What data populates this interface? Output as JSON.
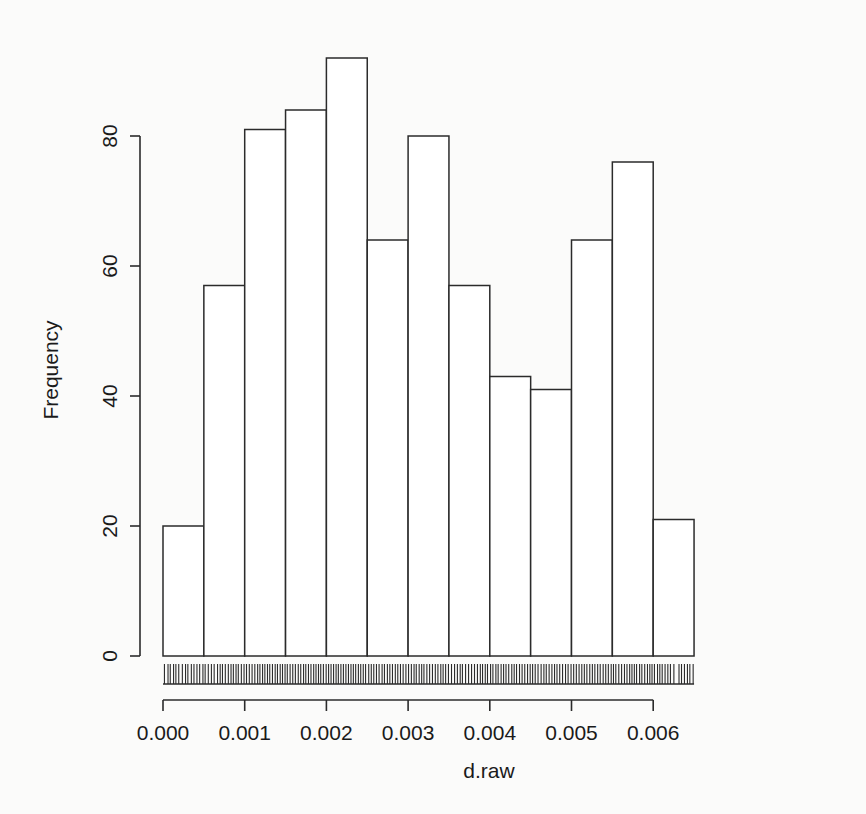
{
  "chart_data": {
    "type": "bar",
    "title": "",
    "subtitle": "",
    "xlabel": "d.raw",
    "ylabel": "Frequency",
    "xlim": [
      -0.0001,
      0.00645
    ],
    "ylim": [
      0,
      92
    ],
    "grid": false,
    "legend": false,
    "legend_position": "none",
    "bin_width": 0.0005,
    "bin_edges": [
      0.0,
      0.0005,
      0.001,
      0.0015,
      0.002,
      0.0025,
      0.003,
      0.0035,
      0.004,
      0.0045,
      0.005,
      0.0055,
      0.006,
      0.0065
    ],
    "categories": [
      "0.0000-0.0005",
      "0.0005-0.0010",
      "0.0010-0.0015",
      "0.0015-0.0020",
      "0.0020-0.0025",
      "0.0025-0.0030",
      "0.0030-0.0035",
      "0.0035-0.0040",
      "0.0040-0.0045",
      "0.0045-0.0050",
      "0.0050-0.0055",
      "0.0055-0.0060",
      "0.0060-0.0065"
    ],
    "values": [
      20,
      57,
      81,
      84,
      92,
      64,
      80,
      57,
      43,
      41,
      64,
      76,
      21
    ],
    "xticks": [
      0.0,
      0.001,
      0.002,
      0.003,
      0.004,
      0.005,
      0.006
    ],
    "xtick_labels": [
      "0.000",
      "0.001",
      "0.002",
      "0.003",
      "0.004",
      "0.005",
      "0.006"
    ],
    "yticks": [
      0,
      20,
      40,
      60,
      80
    ],
    "ytick_labels": [
      "0",
      "20",
      "40",
      "60",
      "80"
    ],
    "rug": true,
    "rug_note": "rug plot of individual observations drawn beneath baseline",
    "bar_fill": "#ffffff",
    "bar_stroke": "#2b2b2b",
    "background": "#fbfbfa"
  },
  "axes": {
    "y_axis_name": "Frequency",
    "x_axis_name": "d.raw"
  }
}
